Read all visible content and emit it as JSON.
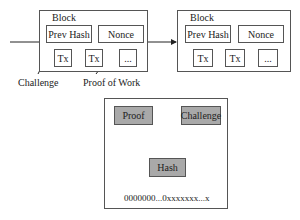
{
  "blocks": [
    {
      "title": "Block",
      "prev_hash": "Prev Hash",
      "nonce": "Nonce",
      "txs": [
        "Tx",
        "Tx",
        "..."
      ]
    },
    {
      "title": "Block",
      "prev_hash": "Prev Hash",
      "nonce": "Nonce",
      "txs": [
        "Tx",
        "Tx",
        "..."
      ]
    }
  ],
  "annotations": {
    "challenge": "Challenge",
    "proof_of_work": "Proof of Work"
  },
  "hash_panel": {
    "proof": "Proof",
    "plus": "+",
    "challenge": "Challenge",
    "hash": "Hash",
    "output": "0000000...0xxxxxxx...x"
  },
  "colors": {
    "box_fill": "#ffffff",
    "gray_fill": "#a9a9a9",
    "stroke": "#555555"
  }
}
